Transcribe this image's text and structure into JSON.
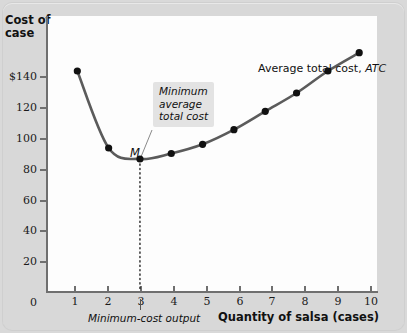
{
  "chart_data": {
    "type": "line",
    "title": "",
    "xlabel": "Quantity of salsa (cases)",
    "ylabel": "Cost of case",
    "ylabel_line1": "Cost of",
    "ylabel_line2": "case",
    "xlim": [
      0,
      10.6
    ],
    "ylim": [
      0,
      150
    ],
    "grid": false,
    "legend_position": "inside-top-right",
    "series": [
      {
        "name": "Average total cost, ATC",
        "x": [
          1,
          2,
          3,
          4,
          5,
          6,
          7,
          8,
          9,
          10
        ],
        "values": [
          120,
          78,
          72,
          75,
          80,
          88,
          98,
          108,
          120,
          130
        ],
        "color": "#5b5b5b",
        "marker_color": "#111111"
      }
    ],
    "y_ticks": [
      0,
      20,
      40,
      60,
      80,
      100,
      120,
      140
    ],
    "y_tick_labels": [
      "0",
      "20",
      "40",
      "60",
      "80",
      "100",
      "120",
      "$140"
    ],
    "x_ticks": [
      1,
      2,
      3,
      4,
      5,
      6,
      7,
      8,
      9,
      10
    ],
    "x_tick_labels": [
      "1",
      "2",
      "3",
      "4",
      "5",
      "6",
      "7",
      "8",
      "9",
      "10"
    ],
    "annotations": [
      {
        "id": "minimum-point-marker",
        "text": "M",
        "x": 3,
        "y": 72
      },
      {
        "id": "minimum-average-total-cost-callout",
        "text": "Minimum average total cost",
        "line1": "Minimum",
        "line2": "average",
        "line3": "total cost",
        "points_to_x": 3,
        "points_to_y": 72
      },
      {
        "id": "minimum-cost-output-label",
        "text": "Minimum-cost output",
        "at_x": 3
      }
    ],
    "series_label": {
      "prefix": "Average total cost, ",
      "abbr": "ATC"
    }
  },
  "colors": {
    "background": "#d8d8d8",
    "canvas": "#fdfdfd",
    "axis": "#6f6f6f",
    "curve": "#5b5b5b",
    "marker": "#111111",
    "callout_bg": "#e3e3e3",
    "text": "#111111"
  }
}
